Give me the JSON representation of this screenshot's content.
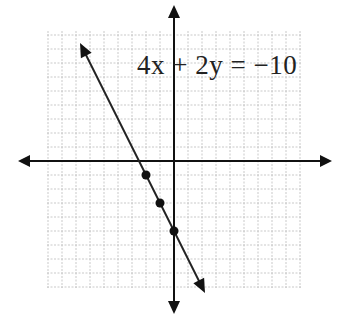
{
  "chart_data": {
    "type": "line",
    "title": "4x + 2y = −10",
    "equation": "4x + 2y = −10",
    "xlabel": "",
    "ylabel": "",
    "xlim": [
      -9,
      9
    ],
    "ylim": [
      -9,
      9
    ],
    "grid": true,
    "legend": "none",
    "series": [
      {
        "name": "4x + 2y = −10",
        "slope": -2,
        "intercept": -5,
        "x": [
          -6.5,
          2
        ],
        "y": [
          8,
          -9
        ]
      }
    ],
    "points": [
      {
        "x": -2,
        "y": -1
      },
      {
        "x": -1,
        "y": -3
      },
      {
        "x": 0,
        "y": -5
      }
    ]
  },
  "label": {
    "equation_text": "4x + 2y = −10"
  }
}
